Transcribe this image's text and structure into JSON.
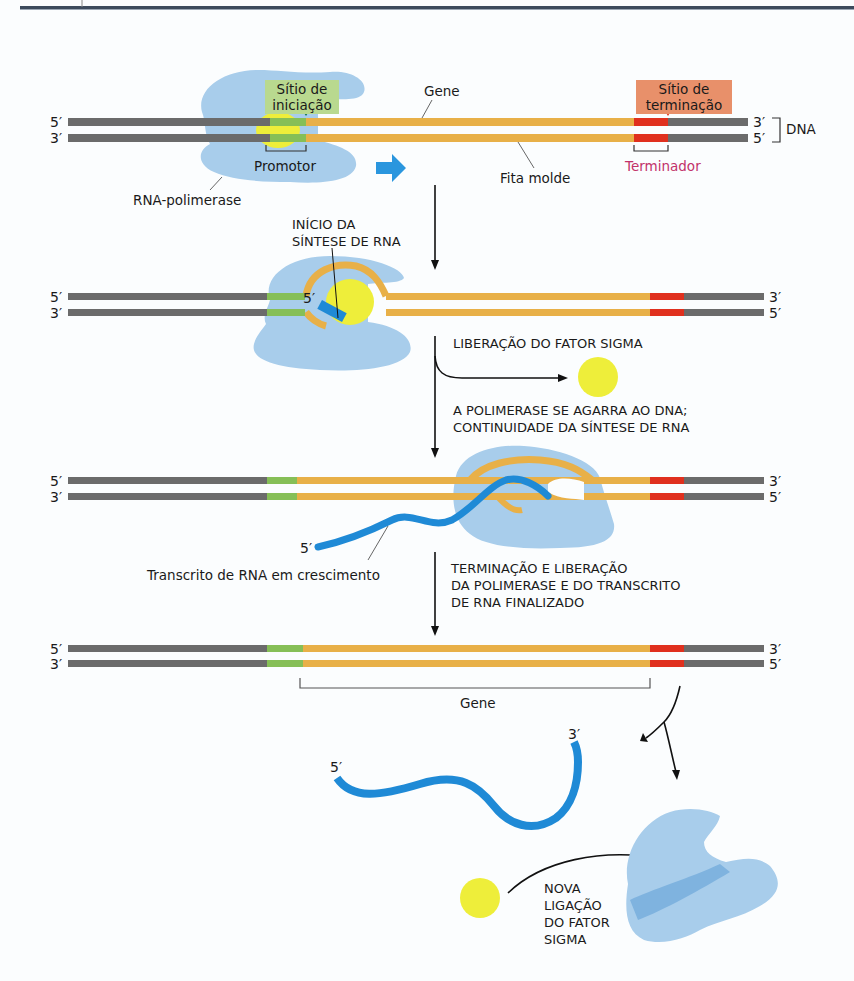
{
  "figure": {
    "topic": "Bacterial transcription cycle",
    "colors": {
      "dna_flank": "#6b6b6b",
      "promoter": "#86bf57",
      "gene": "#e8b048",
      "terminator": "#e0301e",
      "polymerase": "#a8cdeb",
      "polymerase_dark": "#7fb3df",
      "sigma_factor": "#eeee3a",
      "rna": "#1f8ad6",
      "initiation_marker": "#1d7a55",
      "termination_marker": "#e0301e",
      "direction_arrow": "#2a96de",
      "header_rule": "#3c4a5c"
    }
  },
  "row1": {
    "initiation_site": [
      "Sítio de",
      "iniciação"
    ],
    "termination_site": [
      "Sítio de",
      "terminação"
    ],
    "gene_label": "Gene",
    "template_strand_label": "Fita molde",
    "promoter_label": "Promotor",
    "terminator_label": "Terminador",
    "polymerase_label": "RNA-polimerase",
    "dna_label": "DNA",
    "left_top": "5′",
    "left_bottom": "3′",
    "right_top": "3′",
    "right_bottom": "5′"
  },
  "step1": {
    "line1": "INÍCIO DA",
    "line2": "SÍNTESE DE RNA"
  },
  "row2": {
    "left_top": "5′",
    "left_bottom": "3′",
    "right_top": "3′",
    "right_bottom": "5′",
    "rna_5prime": "5′"
  },
  "step2": {
    "line1": "LIBERAÇÃO DO FATOR SIGMA"
  },
  "step3": {
    "line1": "A POLIMERASE SE AGARRA AO DNA;",
    "line2": "CONTINUIDADE DA SÍNTESE DE RNA"
  },
  "row3": {
    "left_top": "5′",
    "left_bottom": "3′",
    "right_top": "3′",
    "right_bottom": "5′",
    "rna_5prime": "5′",
    "transcript_label": "Transcrito de RNA em crescimento"
  },
  "step4": {
    "line1": "TERMINAÇÃO E LIBERAÇÃO",
    "line2": "DA POLIMERASE E DO TRANSCRITO",
    "line3": "DE RNA FINALIZADO"
  },
  "row4": {
    "left_top": "5′",
    "left_bottom": "3′",
    "right_top": "3′",
    "right_bottom": "5′",
    "gene_label": "Gene"
  },
  "released": {
    "rna_5prime": "5′",
    "rna_3prime": "3′",
    "rebind_line1": "NOVA",
    "rebind_line2": "LIGAÇÃO",
    "rebind_line3": "DO FATOR",
    "rebind_line4": "SIGMA"
  }
}
